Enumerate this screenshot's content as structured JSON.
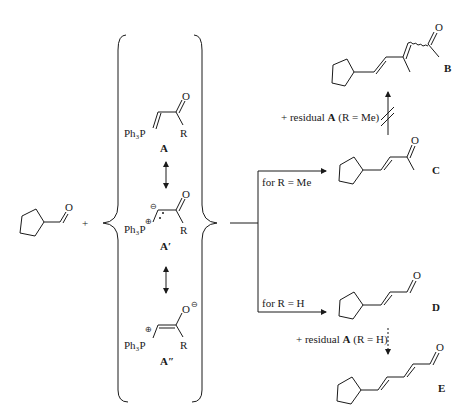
{
  "reactant": {
    "name": "cyclopentanecarbaldehyde",
    "atom_O": "O"
  },
  "plus": "+",
  "ylide": {
    "A": {
      "label": "A",
      "ph3p": "Ph₃P",
      "O": "O",
      "R": "R"
    },
    "A1": {
      "label": "A′",
      "ph3p": "Ph₃P",
      "O": "O",
      "R": "R",
      "charge_p": "⊕",
      "charge_c": "⊖"
    },
    "A2": {
      "label": "A″",
      "ph3p": "Ph₃P",
      "O": "O",
      "R": "R",
      "charge_p": "⊕",
      "charge_o": "⊖"
    }
  },
  "conditions": {
    "me": "for R = Me",
    "h": "for R = H",
    "residual_me_prefix": "+ residual ",
    "residual_me_A": "A",
    "residual_me_suffix": " (R = Me)",
    "residual_h_prefix": "+ residual ",
    "residual_h_A": "A",
    "residual_h_suffix": " (R = H)"
  },
  "products": {
    "B": {
      "label": "B",
      "O": "O"
    },
    "C": {
      "label": "C",
      "O": "O"
    },
    "D": {
      "label": "D",
      "O": "O"
    },
    "E": {
      "label": "E",
      "O": "O"
    }
  }
}
